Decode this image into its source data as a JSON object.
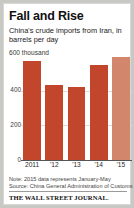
{
  "chart_data": {
    "type": "bar",
    "title": "Fall and Rise",
    "subtitle": "China's crude imports from Iran, in barrels per day",
    "unit_label": "600 thousand",
    "xlabel": "",
    "ylabel": "",
    "ylim": [
      0,
      600
    ],
    "yticks": [
      400,
      200,
      0
    ],
    "ytick_labels": [
      "400",
      "200",
      "0"
    ],
    "grid": true,
    "legend": "none",
    "categories": [
      "2011",
      "'12",
      "'13",
      "'14",
      "'15"
    ],
    "values": [
      570,
      430,
      420,
      550,
      595
    ],
    "bar_colors": [
      "#c1462c",
      "#c1462c",
      "#c1462c",
      "#c1462c",
      "#d2866b"
    ],
    "note": "Note: 2015 data represents January-May",
    "source": "Source: China General Administration of Customs",
    "brand": "THE WALL STREET JOURNAL."
  },
  "colors": {
    "bar_primary": "#c1462c",
    "bar_highlight": "#d2866b",
    "axis": "#555555",
    "grid": "#dcdcdc",
    "text": "#111111",
    "page_background": "#c8c8c4",
    "figure_background": "#ffffff"
  }
}
